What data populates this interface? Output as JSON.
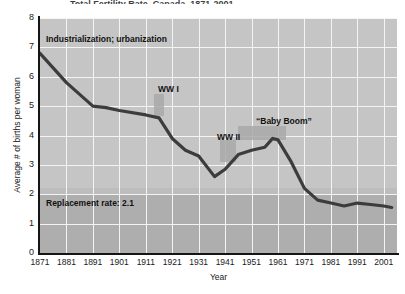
{
  "chart_data": {
    "type": "line",
    "title": "Total Fertility Rate, Canada, 1871-2001",
    "xlabel": "Year",
    "ylabel": "Average # of births per woman",
    "xlim": [
      1871,
      2006
    ],
    "ylim": [
      0,
      8
    ],
    "yticks": [
      0,
      1,
      2,
      3,
      4,
      5,
      6,
      7,
      8
    ],
    "xticks": [
      1871,
      1881,
      1891,
      1901,
      1911,
      1921,
      1931,
      1941,
      1951,
      1961,
      1971,
      1981,
      1991,
      2001
    ],
    "grid": true,
    "legend": "none",
    "series": [
      {
        "name": "Total fertility rate",
        "x": [
          1871,
          1881,
          1891,
          1896,
          1901,
          1911,
          1916,
          1921,
          1926,
          1931,
          1937,
          1941,
          1946,
          1951,
          1956,
          1959,
          1961,
          1966,
          1971,
          1976,
          1981,
          1986,
          1991,
          1996,
          2001,
          2004
        ],
        "values": [
          6.8,
          5.8,
          5.0,
          4.95,
          4.85,
          4.7,
          4.6,
          3.9,
          3.5,
          3.3,
          2.6,
          2.85,
          3.35,
          3.5,
          3.6,
          3.9,
          3.85,
          3.1,
          2.2,
          1.8,
          1.7,
          1.6,
          1.7,
          1.65,
          1.6,
          1.55
        ]
      }
    ],
    "annotations": [
      {
        "id": "industrialization",
        "text": "Industrialization; urbanization",
        "x": 1873,
        "y": 7.2
      },
      {
        "id": "ww1",
        "text": "WW I",
        "x": 1914,
        "y": 4.55
      },
      {
        "id": "ww2",
        "text": "WW II",
        "x": 1941,
        "y": 3.2
      },
      {
        "id": "babyboom",
        "text": "“Baby Boom”",
        "x": 1954,
        "y": 4.1
      },
      {
        "id": "replacement",
        "text": "Replacement rate: 2.1",
        "x": 1873,
        "y": 1.85
      }
    ],
    "bands": [
      {
        "id": "replacement-band",
        "label": "Replacement rate: 2.1",
        "value": 2.1,
        "orientation": "horizontal"
      },
      {
        "id": "ww1-shade",
        "label": "WW I",
        "x_start": 1914,
        "x_end": 1918,
        "orientation": "vertical"
      },
      {
        "id": "ww2-shade",
        "label": "WW II",
        "x_start": 1939,
        "x_end": 1945,
        "orientation": "vertical"
      },
      {
        "id": "babyboom-shade",
        "label": "“Baby Boom”",
        "x_start": 1946,
        "x_end": 1964,
        "orientation": "vertical"
      }
    ],
    "colors": {
      "line": "#3c3c3c",
      "panel_upper": "#c5c5c5",
      "panel_lower": "#aeaeae",
      "gridline": "#f4f4f4",
      "axis": "#151515",
      "shade": "#a8a8a8",
      "text": "#1a1a1a"
    }
  }
}
